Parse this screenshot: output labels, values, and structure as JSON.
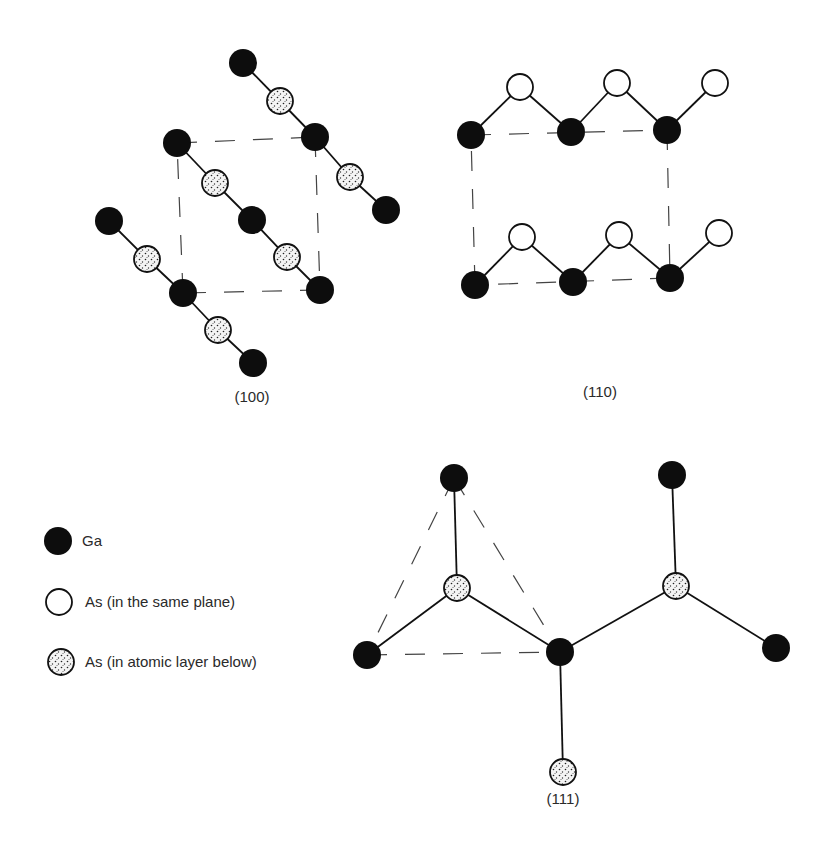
{
  "colors": {
    "ga_fill": "#0d0d0d",
    "as_same_fill": "#ffffff",
    "as_below_fill": "#f4f4f4",
    "stroke": "#111111",
    "dash": "#444444",
    "text": "#2a2a2a"
  },
  "legend": {
    "items": [
      {
        "type": "ga",
        "label": "Ga",
        "cx": 58,
        "cy": 541
      },
      {
        "type": "as_same",
        "label": "As (in the same plane)",
        "cx": 59,
        "cy": 602
      },
      {
        "type": "as_below",
        "label": "As (in atomic layer below)",
        "cx": 61,
        "cy": 662
      }
    ]
  },
  "panels": [
    {
      "id": "p100",
      "caption": "(100)",
      "caption_x": 252,
      "caption_y": 388,
      "atoms": [
        {
          "type": "ga",
          "x": 243,
          "y": 63
        },
        {
          "type": "as_below",
          "x": 280,
          "y": 101
        },
        {
          "type": "ga",
          "x": 315,
          "y": 137
        },
        {
          "type": "as_below",
          "x": 350,
          "y": 177
        },
        {
          "type": "ga",
          "x": 386,
          "y": 210
        },
        {
          "type": "ga",
          "x": 177,
          "y": 143
        },
        {
          "type": "as_below",
          "x": 215,
          "y": 183
        },
        {
          "type": "ga",
          "x": 252,
          "y": 220
        },
        {
          "type": "as_below",
          "x": 287,
          "y": 257
        },
        {
          "type": "ga",
          "x": 320,
          "y": 290
        },
        {
          "type": "ga",
          "x": 109,
          "y": 221
        },
        {
          "type": "as_below",
          "x": 147,
          "y": 259
        },
        {
          "type": "ga",
          "x": 183,
          "y": 293
        },
        {
          "type": "as_below",
          "x": 218,
          "y": 330
        },
        {
          "type": "ga",
          "x": 253,
          "y": 363
        }
      ],
      "bonds": [
        [
          0,
          1
        ],
        [
          1,
          2
        ],
        [
          2,
          3
        ],
        [
          3,
          4
        ],
        [
          5,
          6
        ],
        [
          6,
          7
        ],
        [
          7,
          8
        ],
        [
          8,
          9
        ],
        [
          10,
          11
        ],
        [
          11,
          12
        ],
        [
          12,
          13
        ],
        [
          13,
          14
        ]
      ],
      "dashed": [
        [
          177,
          143,
          315,
          137
        ],
        [
          315,
          137,
          320,
          290
        ],
        [
          320,
          290,
          183,
          293
        ],
        [
          183,
          293,
          177,
          143
        ]
      ]
    },
    {
      "id": "p110",
      "caption": "(110)",
      "caption_x": 600,
      "caption_y": 383,
      "atoms": [
        {
          "type": "ga",
          "x": 471,
          "y": 135
        },
        {
          "type": "as_same",
          "x": 520,
          "y": 87
        },
        {
          "type": "ga",
          "x": 571,
          "y": 132
        },
        {
          "type": "as_same",
          "x": 617,
          "y": 83
        },
        {
          "type": "ga",
          "x": 667,
          "y": 130
        },
        {
          "type": "as_same",
          "x": 715,
          "y": 83
        },
        {
          "type": "ga",
          "x": 475,
          "y": 285
        },
        {
          "type": "as_same",
          "x": 522,
          "y": 237
        },
        {
          "type": "ga",
          "x": 573,
          "y": 282
        },
        {
          "type": "as_same",
          "x": 619,
          "y": 235
        },
        {
          "type": "ga",
          "x": 670,
          "y": 278
        },
        {
          "type": "as_same",
          "x": 719,
          "y": 233
        }
      ],
      "bonds": [
        [
          0,
          1
        ],
        [
          1,
          2
        ],
        [
          2,
          3
        ],
        [
          3,
          4
        ],
        [
          4,
          5
        ],
        [
          6,
          7
        ],
        [
          7,
          8
        ],
        [
          8,
          9
        ],
        [
          9,
          10
        ],
        [
          10,
          11
        ]
      ],
      "dashed": [
        [
          471,
          135,
          667,
          130
        ],
        [
          667,
          130,
          670,
          278
        ],
        [
          670,
          278,
          475,
          285
        ],
        [
          475,
          285,
          471,
          135
        ]
      ]
    },
    {
      "id": "p111",
      "caption": "(111)",
      "caption_x": 563,
      "caption_y": 790,
      "atoms": [
        {
          "type": "ga",
          "x": 454,
          "y": 478
        },
        {
          "type": "as_below",
          "x": 457,
          "y": 588
        },
        {
          "type": "ga",
          "x": 367,
          "y": 655
        },
        {
          "type": "ga",
          "x": 560,
          "y": 652
        },
        {
          "type": "ga",
          "x": 672,
          "y": 475
        },
        {
          "type": "as_below",
          "x": 676,
          "y": 586
        },
        {
          "type": "ga",
          "x": 776,
          "y": 648
        },
        {
          "type": "as_below",
          "x": 563,
          "y": 772
        }
      ],
      "bonds": [
        [
          0,
          1
        ],
        [
          1,
          2
        ],
        [
          1,
          3
        ],
        [
          3,
          5
        ],
        [
          4,
          5
        ],
        [
          5,
          6
        ],
        [
          3,
          7
        ]
      ],
      "dashed": [
        [
          454,
          478,
          367,
          655
        ],
        [
          454,
          478,
          560,
          652
        ],
        [
          367,
          655,
          560,
          652
        ]
      ]
    }
  ]
}
